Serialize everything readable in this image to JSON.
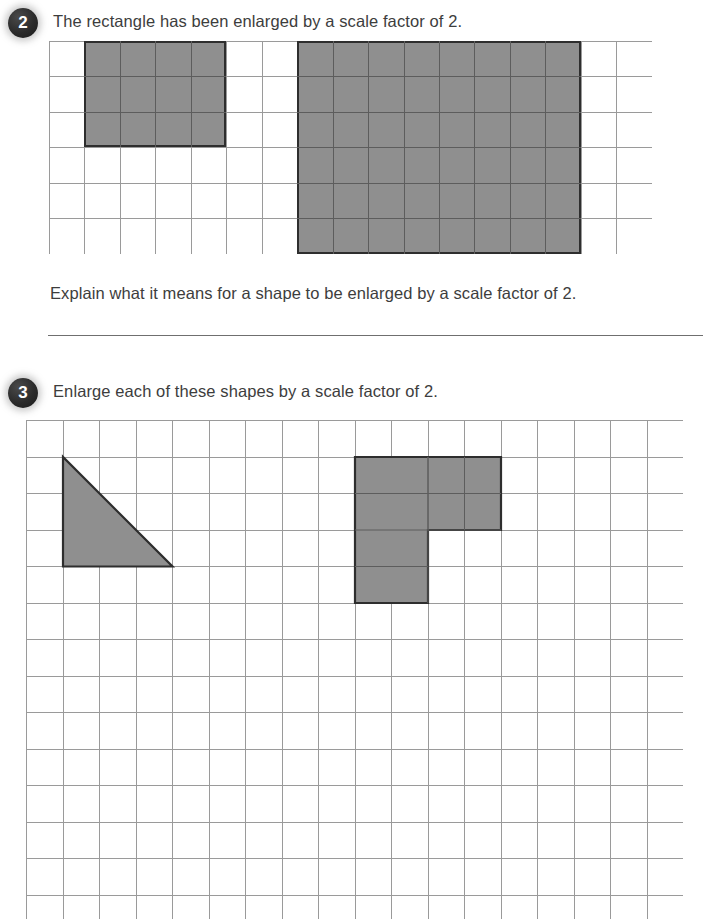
{
  "page": {
    "width": 706,
    "height": 919,
    "background": "#ffffff",
    "shape_fill": "#8f8f8f",
    "shape_stroke": "#2e2e2e",
    "grid_line_color": "#9a9a9a",
    "badge_color": "#2b2b2b",
    "text_color": "#3d3d3d"
  },
  "questions": [
    {
      "number": "2",
      "prompt": "The rectangle has been enlarged by a scale factor of 2.",
      "sub_prompt": "Explain what it means for a shape to be enlarged by a scale factor of 2.",
      "answer_line": true,
      "grid": {
        "x": 49,
        "y": 41,
        "cols": 17,
        "rows": 6,
        "cell": 35.45
      },
      "shapes": [
        {
          "name": "original-rectangle",
          "type": "rectangle",
          "col": 1,
          "row": 0,
          "width_cells": 4,
          "height_cells": 3,
          "label": "original rectangle 4 by 3"
        },
        {
          "name": "enlarged-rectangle",
          "type": "rectangle",
          "col": 7,
          "row": 0,
          "width_cells": 8,
          "height_cells": 6,
          "label": "enlarged rectangle 8 by 6"
        }
      ]
    },
    {
      "number": "3",
      "prompt": "Enlarge each of these shapes by a scale factor of 2.",
      "sub_prompt": "",
      "answer_line": false,
      "grid": {
        "x": 26,
        "y": 420,
        "cols": 18,
        "rows": 14,
        "cell": 36.5
      },
      "shapes": [
        {
          "name": "triangle-shape",
          "type": "triangle",
          "col": 1,
          "row": 1,
          "width_cells": 3,
          "height_cells": 3,
          "label": "right-angled triangle base 3 height 3"
        },
        {
          "name": "l-shape",
          "type": "lshape",
          "col": 9,
          "row": 1,
          "top_width_cells": 4,
          "top_height_cells": 2,
          "leg_width_cells": 2,
          "leg_height_cells": 2,
          "label": "L shape"
        }
      ]
    }
  ]
}
